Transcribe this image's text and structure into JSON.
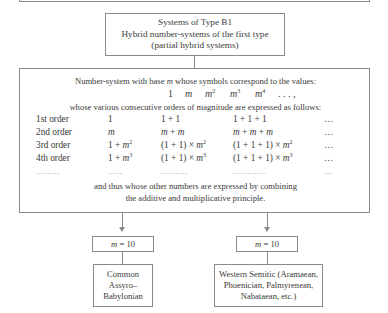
{
  "title_box": {
    "line1": "Systems of Type B1",
    "line2": "Hybrid number-systems of the first type",
    "line3": "(partial hybrid systems)"
  },
  "main_box": {
    "intro": "Number-system with base m whose symbols correspond to the values:",
    "values": [
      "1",
      "m",
      "m²",
      "m³",
      "m⁴",
      "…,"
    ],
    "orders_intro": "whose various consecutive orders of magnitude are expressed as follows:",
    "rows": [
      {
        "label": "1st order",
        "c1": "1",
        "c2": "1 + 1",
        "c3": "1 + 1 + 1",
        "c4": "…"
      },
      {
        "label": "2nd order",
        "c1": "m",
        "c2": "m + m",
        "c3": "m + m + m",
        "c4": "…"
      },
      {
        "label": "3rd order",
        "c1": "1 + m²",
        "c2": "(1 + 1) × m²",
        "c3": "(1 + 1 + 1) × m²",
        "c4": "…"
      },
      {
        "label": "4th order",
        "c1": "1 + m³",
        "c2": "(1 + 1) × m³",
        "c3": "(1 + 1 + 1) × m³",
        "c4": "…"
      },
      {
        "label": "........",
        "c1": ".....",
        "c2": ".........",
        "c3": "...........",
        "c4": "…"
      }
    ],
    "outro_line1": "and thus whose other numbers are expressed by combining",
    "outro_line2": "the additive and multiplicative principle."
  },
  "branches": [
    {
      "base": "m = 10",
      "line1": "Common",
      "line2": "Assyro–",
      "line3": "Babylonian"
    },
    {
      "base": "m = 10",
      "line1": "Western Semitic (Aramaean,",
      "line2": "Phoenician, Palmyrenean,",
      "line3": "Nabataean, etc.)"
    }
  ]
}
